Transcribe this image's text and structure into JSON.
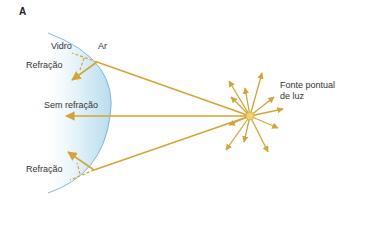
{
  "figure": {
    "panel_label": "A",
    "labels": {
      "glass": "Vidro",
      "air": "Ar",
      "refraction_top": "Refração",
      "no_refraction": "Sem refração",
      "refraction_bottom": "Refração",
      "source_line1": "Fonte pontual",
      "source_line2": "de luz"
    },
    "colors": {
      "ray": "#d4a535",
      "lens_fill": "#cfe8f3",
      "lens_edge": "#6aa9d4",
      "text": "#333333"
    }
  }
}
